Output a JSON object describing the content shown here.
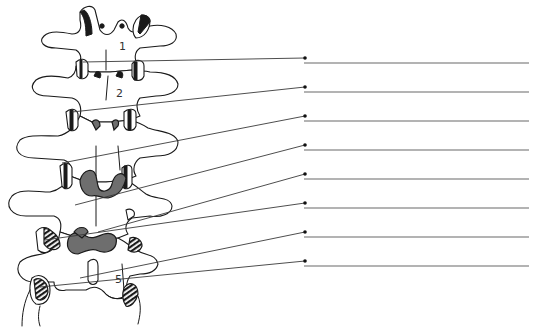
{
  "figure": {
    "type": "anatomical-labeling-worksheet",
    "vertebra_labels": [
      {
        "text": "1",
        "x": 121,
        "y": 48
      },
      {
        "text": "2",
        "x": 118,
        "y": 95
      },
      {
        "text": "5",
        "x": 117,
        "y": 281
      }
    ],
    "leaders": [
      {
        "index": 1,
        "from": [
          83,
          62
        ],
        "dot": [
          305,
          58
        ]
      },
      {
        "index": 2,
        "from": [
          72,
          112
        ],
        "dot": [
          305,
          87
        ]
      },
      {
        "index": 3,
        "from": [
          62,
          163
        ],
        "dot": [
          305,
          116
        ]
      },
      {
        "index": 4,
        "from": [
          75,
          205
        ],
        "dot": [
          305,
          145
        ]
      },
      {
        "index": 5,
        "from": [
          98,
          232
        ],
        "dot": [
          305,
          174
        ]
      },
      {
        "index": 6,
        "from": [
          45,
          240
        ],
        "dot": [
          305,
          203
        ]
      },
      {
        "index": 7,
        "from": [
          80,
          278
        ],
        "dot": [
          305,
          232
        ]
      },
      {
        "index": 8,
        "from": [
          40,
          287
        ],
        "dot": [
          305,
          261
        ]
      }
    ],
    "answer_lines": [
      {
        "index": 1,
        "x1": 304,
        "x2": 529,
        "y": 63,
        "value": ""
      },
      {
        "index": 2,
        "x1": 304,
        "x2": 529,
        "y": 92,
        "value": ""
      },
      {
        "index": 3,
        "x1": 304,
        "x2": 529,
        "y": 121,
        "value": ""
      },
      {
        "index": 4,
        "x1": 304,
        "x2": 529,
        "y": 150,
        "value": ""
      },
      {
        "index": 5,
        "x1": 304,
        "x2": 529,
        "y": 179,
        "value": ""
      },
      {
        "index": 6,
        "x1": 304,
        "x2": 529,
        "y": 208,
        "value": ""
      },
      {
        "index": 7,
        "x1": 304,
        "x2": 529,
        "y": 237,
        "value": ""
      },
      {
        "index": 8,
        "x1": 304,
        "x2": 529,
        "y": 266,
        "value": ""
      }
    ],
    "colors": {
      "outline": "#1a1a1a",
      "ligament_fill": "#6e6e6e",
      "leader": "#3a3a3a",
      "answer_line": "#9a9a9a",
      "background": "#ffffff"
    }
  }
}
